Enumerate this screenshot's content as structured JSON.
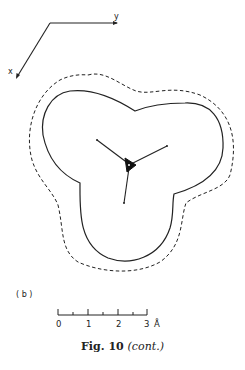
{
  "figure": {
    "panel_label": "( b )",
    "axes": {
      "x_label": "x",
      "y_label": "y"
    },
    "contours": {
      "solid": "inner contour (solid)",
      "dashed": "outer contour (dashed)"
    },
    "scale_bar": {
      "ticks": [
        "0",
        "1",
        "2",
        "3"
      ],
      "unit": "Å"
    },
    "caption": {
      "prefix": "Fig. 10",
      "suffix": "(cont.)"
    }
  }
}
